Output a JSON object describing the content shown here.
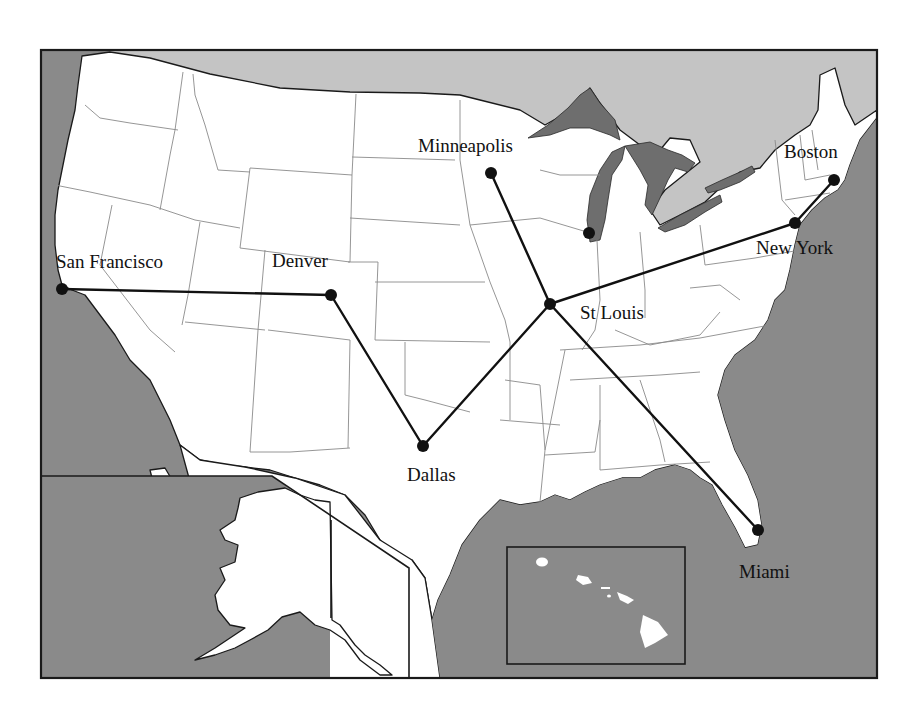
{
  "map": {
    "type": "route-network",
    "region": "United States",
    "colors": {
      "ocean": "#8a8a8a",
      "canada": "#c4c4c4",
      "land": "#ffffff",
      "lakes": "#6e6e6e",
      "routes": "#111111"
    },
    "cities": [
      {
        "id": "sf",
        "name": "San Francisco",
        "x": 62,
        "y": 289,
        "label_x": 56,
        "label_y": 268
      },
      {
        "id": "den",
        "name": "Denver",
        "x": 331,
        "y": 295,
        "label_x": 272,
        "label_y": 267
      },
      {
        "id": "dal",
        "name": "Dallas",
        "x": 423,
        "y": 446,
        "label_x": 407,
        "label_y": 481
      },
      {
        "id": "stl",
        "name": "St Louis",
        "x": 550,
        "y": 304,
        "label_x": 580,
        "label_y": 319
      },
      {
        "id": "min",
        "name": "Minneapolis",
        "x": 491,
        "y": 173,
        "label_x": 418,
        "label_y": 152
      },
      {
        "id": "chi",
        "name": "",
        "x": 589,
        "y": 233
      },
      {
        "id": "ny",
        "name": "New York",
        "x": 795,
        "y": 223,
        "label_x": 756,
        "label_y": 254
      },
      {
        "id": "bos",
        "name": "Boston",
        "x": 834,
        "y": 180,
        "label_x": 784,
        "label_y": 158
      },
      {
        "id": "mia",
        "name": "Miami",
        "x": 758,
        "y": 530,
        "label_x": 739,
        "label_y": 578
      }
    ],
    "routes": [
      {
        "from": "sf",
        "to": "den"
      },
      {
        "from": "den",
        "to": "dal"
      },
      {
        "from": "dal",
        "to": "stl"
      },
      {
        "from": "min",
        "to": "stl"
      },
      {
        "from": "stl",
        "to": "ny"
      },
      {
        "from": "stl",
        "to": "mia"
      },
      {
        "from": "ny",
        "to": "bos"
      }
    ],
    "insets": [
      "Alaska",
      "Hawaii"
    ]
  }
}
